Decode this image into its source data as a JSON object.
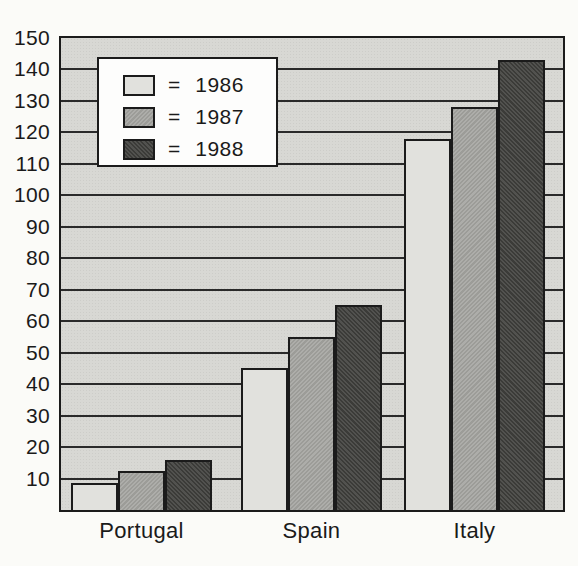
{
  "chart_data": {
    "type": "bar",
    "title": "",
    "categories": [
      "Portugal",
      "Spain",
      "Italy"
    ],
    "series": [
      {
        "name": "1986",
        "values": [
          8.5,
          45,
          118
        ],
        "color": "#e1e1dd"
      },
      {
        "name": "1987",
        "values": [
          12.5,
          55,
          128
        ],
        "color": "#a9a9a5"
      },
      {
        "name": "1988",
        "values": [
          16,
          65,
          143
        ],
        "color": "#434340"
      }
    ],
    "ylim": [
      0,
      150
    ],
    "ytick_step": 10,
    "yticks": [
      10,
      20,
      30,
      40,
      50,
      60,
      70,
      80,
      90,
      100,
      110,
      120,
      130,
      140,
      150
    ],
    "grid": true,
    "legend": {
      "position": "top-left-inside",
      "equals_sign": "=",
      "items": [
        "1986",
        "1987",
        "1988"
      ]
    }
  },
  "colors": {
    "page_background": "#fbfbf8",
    "plot_background": "#d8d8d4",
    "gridline": "#2a2a2a",
    "border": "#1b1b1b",
    "text": "#1a1a1a",
    "legend_background": "#fdfdfc",
    "series_1986": "#e1e1dd",
    "series_1987": "#a9a9a5",
    "series_1988": "#434340"
  }
}
